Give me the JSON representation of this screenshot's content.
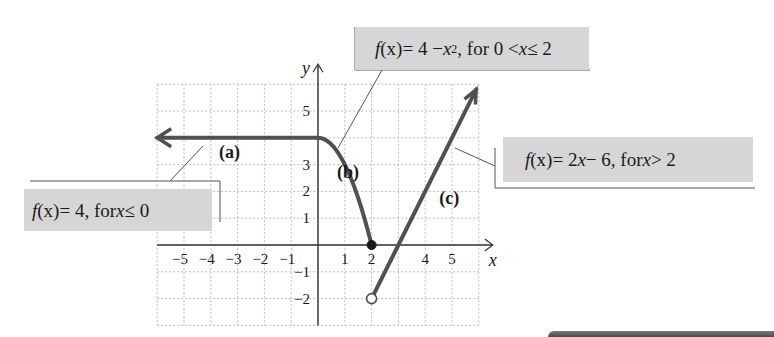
{
  "chart_data": {
    "type": "line",
    "title": "",
    "xlabel": "x",
    "ylabel": "y",
    "xlim": [
      -6,
      6
    ],
    "ylim": [
      -3,
      6
    ],
    "grid": true,
    "x_ticks": [
      -5,
      -4,
      -3,
      -2,
      -1,
      1,
      2,
      4,
      5
    ],
    "y_ticks": [
      5,
      3,
      2,
      1,
      -1,
      -2
    ],
    "x_tick_labels": [
      "−5",
      "−4",
      "−3",
      "−2",
      "−1",
      "1",
      "2",
      "4",
      "5"
    ],
    "y_tick_labels": [
      "5",
      "3",
      "2",
      "1",
      "−1",
      "−2"
    ],
    "series": [
      {
        "name": "(a)",
        "formula": "f(x) = 4, for x ≤ 0",
        "points": [
          [
            -6,
            4
          ],
          [
            0,
            4
          ]
        ],
        "arrow_left": true
      },
      {
        "name": "(b)",
        "formula": "f(x) = 4 − x², for 0 < x ≤ 2",
        "points": [
          [
            0,
            4
          ],
          [
            0.5,
            3.75
          ],
          [
            1,
            3
          ],
          [
            1.5,
            1.75
          ],
          [
            2,
            0
          ]
        ],
        "endpoint": {
          "x": 2,
          "y": 0,
          "style": "closed"
        }
      },
      {
        "name": "(c)",
        "formula": "f(x) = 2x − 6, for x > 2",
        "points": [
          [
            2,
            -2
          ],
          [
            3,
            0
          ],
          [
            4,
            2
          ],
          [
            5,
            4
          ],
          [
            5.9,
            5.8
          ]
        ],
        "startpoint": {
          "x": 2,
          "y": -2,
          "style": "open"
        },
        "arrow_right": true
      }
    ],
    "annotations": [
      {
        "id": "label-a",
        "text": "(a)"
      },
      {
        "id": "label-b",
        "text": "(b)"
      },
      {
        "id": "label-c",
        "text": "(c)"
      }
    ]
  },
  "labels": {
    "a": {
      "fx": "f",
      "paren_x": "(x)",
      "rest": " = 4, for ",
      "var": "x",
      "cond": " ≤ 0"
    },
    "b": {
      "fx": "f",
      "paren_x": "(x)",
      "rest": " = 4 − ",
      "var": "x",
      "sup": "2",
      "cond1": ", for  0 < ",
      "var2": "x",
      "cond2": " ≤ 2"
    },
    "c": {
      "fx": "f",
      "paren_x": "(x)",
      "rest": " = 2",
      "var": "x",
      "cond1": " − 6, for  ",
      "var2": "x",
      "cond2": " > 2"
    }
  },
  "axis_labels": {
    "x": "x",
    "y": "y"
  },
  "curve_tags": {
    "a": "(a)",
    "b": "(b)",
    "c": "(c)"
  },
  "colors": {
    "curve": "#505050",
    "axis": "#333333",
    "grid": "#bdbdbd",
    "label_bg": "#d6d6d6",
    "text": "#1a1a1a"
  }
}
